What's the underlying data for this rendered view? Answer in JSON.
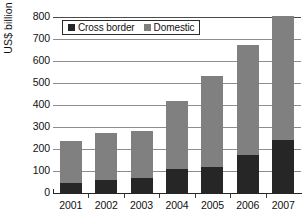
{
  "chart_data": {
    "type": "bar",
    "stacked": true,
    "title": "",
    "xlabel": "",
    "ylabel": "US$ billion",
    "categories": [
      "2001",
      "2002",
      "2003",
      "2004",
      "2005",
      "2006",
      "2007"
    ],
    "series": [
      {
        "name": "Cross border",
        "color": "#262626",
        "values": [
          45,
          60,
          70,
          110,
          120,
          175,
          240
        ]
      },
      {
        "name": "Domestic",
        "color": "#808080",
        "values": [
          190,
          215,
          212,
          310,
          410,
          500,
          565
        ]
      }
    ],
    "totals": [
      235,
      275,
      282,
      420,
      530,
      675,
      805
    ],
    "ylim": [
      0,
      800
    ],
    "yticks": [
      0,
      100,
      200,
      300,
      400,
      500,
      600,
      700,
      800
    ],
    "ytick_labels": [
      "0",
      "100",
      "200",
      "300",
      "400",
      "500",
      "600",
      "700",
      "800"
    ],
    "grid": true,
    "grid_axis": "y",
    "legend_position": "top-inside-left"
  },
  "legend": {
    "entries": [
      {
        "label": "Cross border",
        "swatch": "legend-swatch-cross-border"
      },
      {
        "label": "Domestic",
        "swatch": "legend-swatch-domestic"
      }
    ]
  },
  "axes": {
    "y_title": "US$ billion"
  }
}
